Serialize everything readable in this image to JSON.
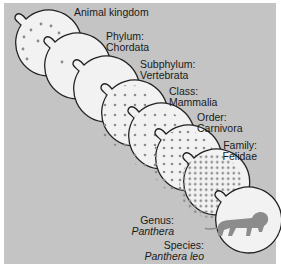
{
  "diagram": {
    "colors": {
      "panel_bg": "#c4c4c4",
      "circle_fill": "#f2f2f2",
      "circle_stroke": "#222222",
      "dot": "#8a8a8a",
      "lion": "#8c8c8c"
    },
    "levels": [
      {
        "rank": "Animal kingdom",
        "taxon": ""
      },
      {
        "rank": "Phylum:",
        "taxon": "Chordata"
      },
      {
        "rank": "Subphylum:",
        "taxon": "Vertebrata"
      },
      {
        "rank": "Class:",
        "taxon": "Mammalia"
      },
      {
        "rank": "Order:",
        "taxon": "Carnivora"
      },
      {
        "rank": "Family:",
        "taxon": "Felidae"
      },
      {
        "rank": "Genus:",
        "taxon": "Panthera"
      },
      {
        "rank": "Species:",
        "taxon": "Panthera leo"
      }
    ],
    "species_icon": "lion-silhouette-icon"
  }
}
